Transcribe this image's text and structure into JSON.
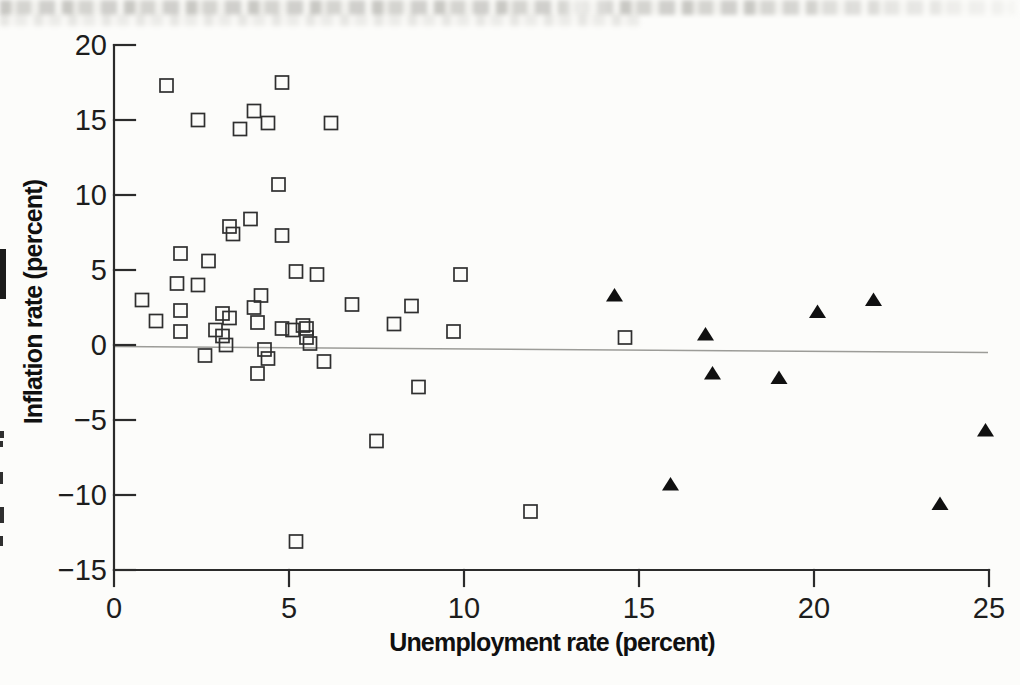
{
  "chart_data": {
    "type": "scatter",
    "title": "",
    "xlabel": "Unemployment rate (percent)",
    "ylabel": "Inflation rate (percent)",
    "xlim": [
      0,
      25
    ],
    "ylim": [
      -15,
      20
    ],
    "grid": false,
    "legend": false,
    "reference_line": {
      "y": 0
    },
    "x_ticks": [
      {
        "value": 0,
        "label": "0"
      },
      {
        "value": 5,
        "label": "5"
      },
      {
        "value": 10,
        "label": "10"
      },
      {
        "value": 15,
        "label": "15"
      },
      {
        "value": 20,
        "label": "20"
      },
      {
        "value": 25,
        "label": "25"
      }
    ],
    "y_ticks": [
      {
        "value": 20,
        "label": "20"
      },
      {
        "value": 15,
        "label": "15"
      },
      {
        "value": 10,
        "label": "10"
      },
      {
        "value": 5,
        "label": "5"
      },
      {
        "value": 0,
        "label": "0"
      },
      {
        "value": -5,
        "label": "−5"
      },
      {
        "value": -10,
        "label": "−10"
      },
      {
        "value": -15,
        "label": "−15"
      }
    ],
    "series": [
      {
        "name": "open-squares",
        "marker": "open-square",
        "color": "#2f2f2f",
        "points": [
          [
            1.5,
            17.3
          ],
          [
            2.4,
            15.0
          ],
          [
            3.6,
            14.4
          ],
          [
            4.0,
            15.6
          ],
          [
            4.4,
            14.8
          ],
          [
            4.8,
            17.5
          ],
          [
            6.2,
            14.8
          ],
          [
            4.7,
            10.7
          ],
          [
            3.9,
            8.4
          ],
          [
            3.3,
            7.9
          ],
          [
            3.4,
            7.4
          ],
          [
            4.8,
            7.3
          ],
          [
            1.9,
            6.1
          ],
          [
            2.7,
            5.6
          ],
          [
            5.2,
            4.9
          ],
          [
            5.8,
            4.7
          ],
          [
            9.9,
            4.7
          ],
          [
            0.8,
            3.0
          ],
          [
            1.8,
            4.1
          ],
          [
            2.4,
            4.0
          ],
          [
            1.2,
            1.6
          ],
          [
            1.9,
            2.3
          ],
          [
            1.9,
            0.9
          ],
          [
            3.1,
            2.1
          ],
          [
            3.3,
            1.8
          ],
          [
            2.9,
            1.0
          ],
          [
            3.1,
            0.6
          ],
          [
            3.2,
            0.0
          ],
          [
            2.6,
            -0.7
          ],
          [
            4.2,
            3.3
          ],
          [
            4.0,
            2.5
          ],
          [
            4.1,
            1.5
          ],
          [
            4.3,
            -0.3
          ],
          [
            4.4,
            -0.9
          ],
          [
            4.1,
            -1.9
          ],
          [
            4.8,
            1.1
          ],
          [
            5.1,
            1.0
          ],
          [
            5.4,
            1.3
          ],
          [
            5.5,
            1.1
          ],
          [
            5.5,
            0.5
          ],
          [
            5.6,
            0.1
          ],
          [
            6.0,
            -1.1
          ],
          [
            6.8,
            2.7
          ],
          [
            8.0,
            1.4
          ],
          [
            8.5,
            2.6
          ],
          [
            9.7,
            0.9
          ],
          [
            14.6,
            0.5
          ],
          [
            8.7,
            -2.8
          ],
          [
            7.5,
            -6.4
          ],
          [
            11.9,
            -11.1
          ],
          [
            5.2,
            -13.1
          ]
        ]
      },
      {
        "name": "filled-triangles",
        "marker": "filled-triangle",
        "color": "#101010",
        "points": [
          [
            14.3,
            3.3
          ],
          [
            16.9,
            0.7
          ],
          [
            17.1,
            -1.9
          ],
          [
            19.0,
            -2.2
          ],
          [
            20.1,
            2.2
          ],
          [
            21.7,
            3.0
          ],
          [
            24.9,
            -5.7
          ],
          [
            15.9,
            -9.3
          ],
          [
            23.6,
            -10.6
          ]
        ]
      }
    ]
  }
}
